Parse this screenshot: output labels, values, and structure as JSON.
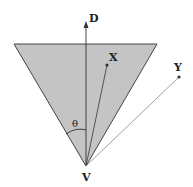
{
  "diagram": {
    "labels": {
      "direction": "D",
      "point_x": "X",
      "point_y": "Y",
      "vertex": "V",
      "angle": "θ"
    },
    "colors": {
      "cone_fill": "#c4c4c4",
      "stroke": "#444444",
      "background": "#ffffff"
    },
    "geometry": {
      "vertex": [
        86,
        166
      ],
      "cone_top_left": [
        14,
        44
      ],
      "cone_top_right": [
        157,
        44
      ],
      "axis_tip": [
        86,
        22
      ],
      "point_x": [
        107,
        65
      ],
      "point_y": [
        179,
        77
      ]
    }
  }
}
